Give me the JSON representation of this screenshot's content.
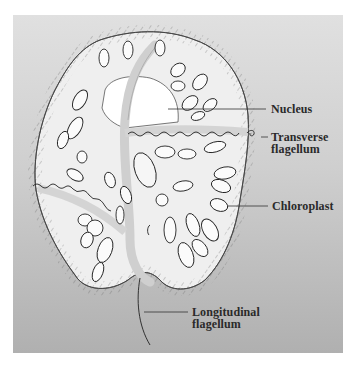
{
  "diagram": {
    "labels": {
      "nucleus": "Nucleus",
      "transverse_flagellum_line1": "Transverse",
      "transverse_flagellum_line2": "flagellum",
      "chloroplast": "Chloroplast",
      "longitudinal_flagellum_line1": "Longitudinal",
      "longitudinal_flagellum_line2": "flagellum"
    },
    "colors": {
      "background_top": "#e0e0e0",
      "background_bottom": "#b0b0b0",
      "cell_fill": "#efefef",
      "outline": "#333333",
      "nucleus_fill": "#ffffff"
    }
  }
}
